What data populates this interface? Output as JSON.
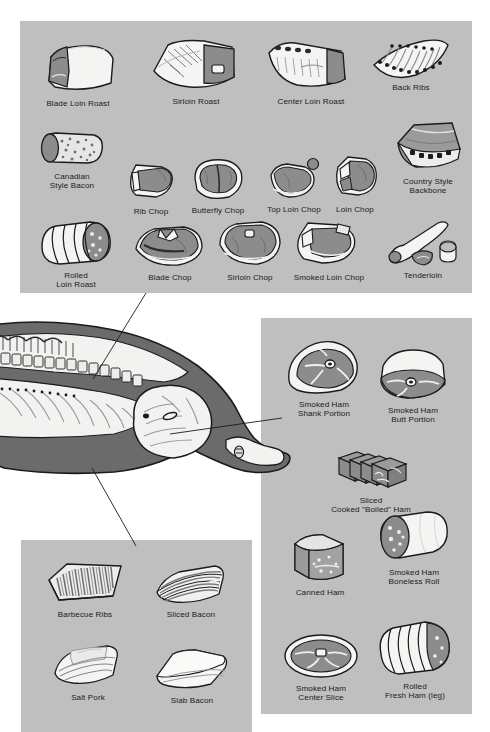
{
  "chart_title": "Pork Retail Cuts Chart",
  "colors": {
    "panel_bg": "#bfbfbf",
    "page_bg": "#ffffff",
    "lean": "#8a8a8a",
    "lean_dark": "#6e6e6e",
    "fat": "#f2f2f0",
    "outline": "#1b1b1b",
    "skin": "#7b7b7b",
    "label_text": "#1b1b1b",
    "leader_line": "#1b1b1b"
  },
  "panels": {
    "loin": {
      "name": "loin-panel",
      "cuts": [
        {
          "label": "Blade Loin Roast",
          "icon": "blade-loin-roast-icon"
        },
        {
          "label": "Sirloin Roast",
          "icon": "sirloin-roast-icon"
        },
        {
          "label": "Center Loin Roast",
          "icon": "center-loin-roast-icon"
        },
        {
          "label": "Back Ribs",
          "icon": "back-ribs-icon"
        },
        {
          "label": "Canadian\nStyle Bacon",
          "icon": "canadian-style-bacon-icon"
        },
        {
          "label": "Rib Chop",
          "icon": "rib-chop-icon"
        },
        {
          "label": "Butterfly Chop",
          "icon": "butterfly-chop-icon"
        },
        {
          "label": "Top Loin Chop",
          "icon": "top-loin-chop-icon"
        },
        {
          "label": "Loin Chop",
          "icon": "loin-chop-icon"
        },
        {
          "label": "Country Style\nBackbone",
          "icon": "country-style-backbone-icon"
        },
        {
          "label": "Rolled\nLoin Roast",
          "icon": "rolled-loin-roast-icon"
        },
        {
          "label": "Blade Chop",
          "icon": "blade-chop-icon"
        },
        {
          "label": "Sirloin Chop",
          "icon": "sirloin-chop-icon"
        },
        {
          "label": "Smoked Loin Chop",
          "icon": "smoked-loin-chop-icon"
        },
        {
          "label": "Tenderloin",
          "icon": "tenderloin-icon"
        }
      ]
    },
    "ham": {
      "name": "ham-panel",
      "cuts": [
        {
          "label": "Smoked Ham\nShank Portion",
          "icon": "smoked-ham-shank-portion-icon"
        },
        {
          "label": "Smoked Ham\nButt Portion",
          "icon": "smoked-ham-butt-portion-icon"
        },
        {
          "label": "Sliced\nCooked \"Boiled\" Ham",
          "icon": "sliced-cooked-boiled-ham-icon"
        },
        {
          "label": "Canned Ham",
          "icon": "canned-ham-icon"
        },
        {
          "label": "Smoked Ham\nBoneless Roll",
          "icon": "smoked-ham-boneless-roll-icon"
        },
        {
          "label": "Smoked Ham\nCenter Slice",
          "icon": "smoked-ham-center-slice-icon"
        },
        {
          "label": "Rolled\nFresh Ham (leg)",
          "icon": "rolled-fresh-ham-leg-icon"
        }
      ]
    },
    "belly": {
      "name": "belly-panel",
      "cuts": [
        {
          "label": "Barbecue Ribs",
          "icon": "barbecue-ribs-icon"
        },
        {
          "label": "Sliced Bacon",
          "icon": "sliced-bacon-icon"
        },
        {
          "label": "Salt Pork",
          "icon": "salt-pork-icon"
        },
        {
          "label": "Slab Bacon",
          "icon": "slab-bacon-icon"
        }
      ]
    }
  },
  "carcass": {
    "name": "pork-carcass-diagram",
    "leader_lines": [
      {
        "name": "leader-loin",
        "from": [
          93,
          379
        ],
        "to": [
          146,
          293
        ]
      },
      {
        "name": "leader-ham",
        "from": [
          170,
          434
        ],
        "to": [
          282,
          418
        ]
      },
      {
        "name": "leader-belly",
        "from": [
          92,
          468
        ],
        "to": [
          136,
          546
        ]
      }
    ]
  }
}
